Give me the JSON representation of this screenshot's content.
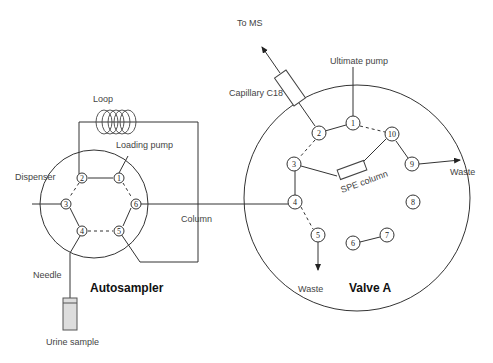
{
  "diagram": {
    "labels": {
      "to_ms": "To MS",
      "capillary": "Capillary C18",
      "ultimate_pump": "Ultimate pump",
      "loop": "Loop",
      "loading_pump": "Loading pump",
      "dispenser": "Dispenser",
      "column": "Column",
      "spe_column": "SPE column",
      "waste_right": "Waste",
      "waste_bottom": "Waste",
      "needle": "Needle",
      "autosampler": "Autosampler",
      "valve_a": "Valve A",
      "urine_sample": "Urine sample"
    },
    "autosampler_ports": [
      "1",
      "2",
      "3",
      "4",
      "5",
      "6"
    ],
    "valve_a_ports": [
      "1",
      "2",
      "3",
      "4",
      "5",
      "6",
      "7",
      "8",
      "9",
      "10"
    ]
  }
}
